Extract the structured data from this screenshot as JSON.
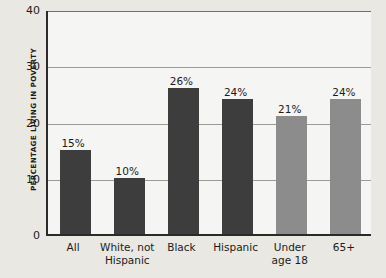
{
  "chart_data": {
    "type": "bar",
    "title": "",
    "xlabel": "",
    "ylabel": "PERCENTAGE LIVING IN POVERTY",
    "ylim": [
      0,
      40
    ],
    "yticks": [
      0,
      10,
      20,
      30,
      40
    ],
    "grid": true,
    "legend": "none",
    "categories": [
      "All",
      "White, not\nHispanic",
      "Black",
      "Hispanic",
      "Under\nage 18",
      "65+"
    ],
    "category_lines": [
      [
        "All"
      ],
      [
        "White, not",
        "Hispanic"
      ],
      [
        "Black"
      ],
      [
        "Hispanic"
      ],
      [
        "Under",
        "age 18"
      ],
      [
        "65+"
      ]
    ],
    "values": [
      15,
      10,
      26,
      24,
      21,
      24
    ],
    "data_labels": [
      "15%",
      "10%",
      "26%",
      "24%",
      "21%",
      "24%"
    ],
    "bar_colors": [
      "#3d3d3d",
      "#3d3d3d",
      "#3d3d3d",
      "#3d3d3d",
      "#8c8c8c",
      "#8c8c8c"
    ],
    "series": [
      {
        "name": "Percentage living in poverty",
        "values": [
          15,
          10,
          26,
          24,
          21,
          24
        ]
      }
    ]
  },
  "colors": {
    "background": "#e9e8e3",
    "plot_background": "#f5f5f3",
    "axis": "#2a2a2a",
    "gridline": "#9a9a96",
    "bar_dark": "#3d3d3d",
    "bar_light": "#8c8c8c",
    "text": "#1c1c1c"
  },
  "axis": {
    "y_tick_labels": [
      "0",
      "10",
      "20",
      "30",
      "40"
    ]
  }
}
